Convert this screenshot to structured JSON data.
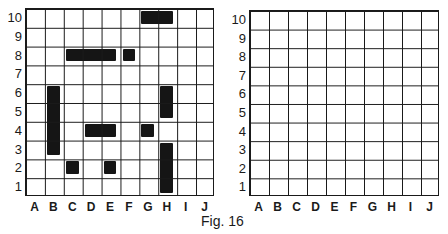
{
  "caption": "Fig. 16",
  "columns": [
    "A",
    "B",
    "C",
    "D",
    "E",
    "F",
    "G",
    "H",
    "I",
    "J"
  ],
  "rows": [
    "10",
    "9",
    "8",
    "7",
    "6",
    "5",
    "4",
    "3",
    "2",
    "1"
  ],
  "boards": [
    {
      "name": "left-board",
      "ships": [
        {
          "cells": [
            "G10",
            "H10"
          ],
          "orientation": "horizontal"
        },
        {
          "cells": [
            "C8",
            "D8",
            "E8"
          ],
          "orientation": "horizontal"
        },
        {
          "cells": [
            "F8"
          ],
          "orientation": "single"
        },
        {
          "cells": [
            "B6",
            "B5",
            "B4",
            "B3"
          ],
          "orientation": "vertical"
        },
        {
          "cells": [
            "H6",
            "H5"
          ],
          "orientation": "vertical"
        },
        {
          "cells": [
            "D4",
            "E4"
          ],
          "orientation": "horizontal"
        },
        {
          "cells": [
            "G4"
          ],
          "orientation": "single"
        },
        {
          "cells": [
            "H3",
            "H2",
            "H1"
          ],
          "orientation": "vertical"
        },
        {
          "cells": [
            "C2"
          ],
          "orientation": "single"
        },
        {
          "cells": [
            "E2"
          ],
          "orientation": "single"
        }
      ]
    },
    {
      "name": "right-board",
      "ships": []
    }
  ]
}
